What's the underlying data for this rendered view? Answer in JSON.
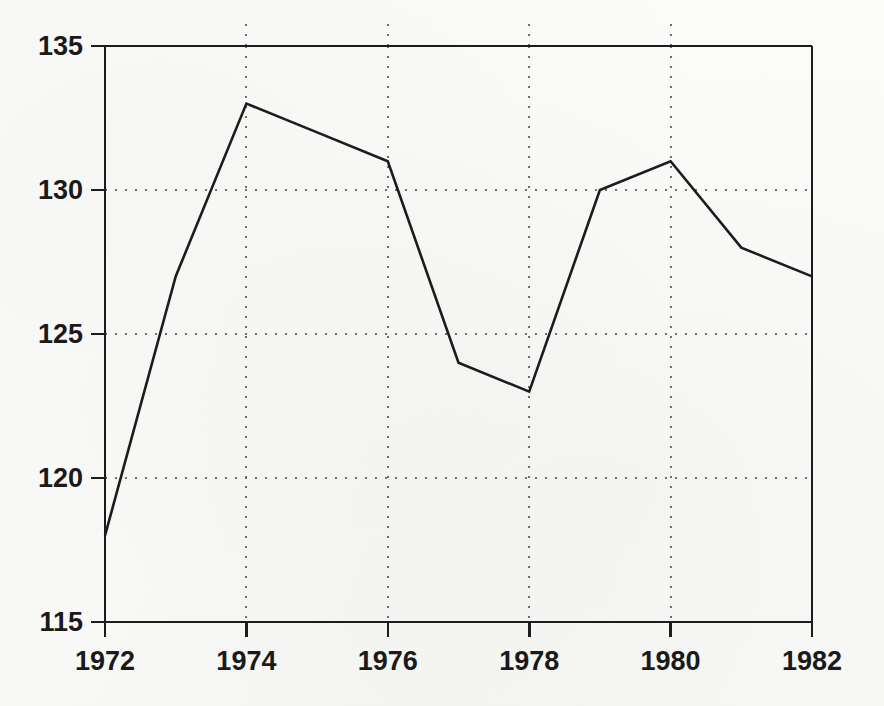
{
  "chart_data": {
    "type": "line",
    "title": "",
    "subtitle": "",
    "xlabel": "",
    "ylabel": "",
    "x": [
      1972,
      1973,
      1974,
      1975,
      1976,
      1977,
      1978,
      1979,
      1980,
      1981,
      1982
    ],
    "values": [
      118,
      127,
      133,
      132,
      131,
      124,
      123,
      130,
      131,
      128,
      127
    ],
    "series": [
      {
        "name": "",
        "values": [
          118,
          127,
          133,
          132,
          131,
          124,
          123,
          130,
          131,
          128,
          127
        ]
      }
    ],
    "xlim": [
      1972,
      1982
    ],
    "ylim": [
      115,
      135
    ],
    "x_tick_labels": [
      "1972",
      "1974",
      "1976",
      "1978",
      "1980",
      "1982"
    ],
    "x_tick_values": [
      1972,
      1974,
      1976,
      1978,
      1980,
      1982
    ],
    "y_tick_labels": [
      "135",
      "130",
      "125",
      "120",
      "115"
    ],
    "y_tick_values": [
      135,
      130,
      125,
      120,
      115
    ],
    "grid": "dotted-both-axes",
    "legend": "none",
    "annotations": [],
    "line_color": "#1c1c1c",
    "grid_color": "#6e6e6e",
    "axis_color": "#1c1c1c",
    "background_color": "#fbfbfa"
  },
  "axes": {
    "y_ticks": [
      {
        "label": "135",
        "value": 135
      },
      {
        "label": "130",
        "value": 130
      },
      {
        "label": "125",
        "value": 125
      },
      {
        "label": "120",
        "value": 120
      },
      {
        "label": "115",
        "value": 115
      }
    ],
    "x_ticks": [
      {
        "label": "1972",
        "value": 1972
      },
      {
        "label": "1974",
        "value": 1974
      },
      {
        "label": "1976",
        "value": 1976
      },
      {
        "label": "1978",
        "value": 1978
      },
      {
        "label": "1980",
        "value": 1980
      },
      {
        "label": "1982",
        "value": 1982
      }
    ]
  }
}
